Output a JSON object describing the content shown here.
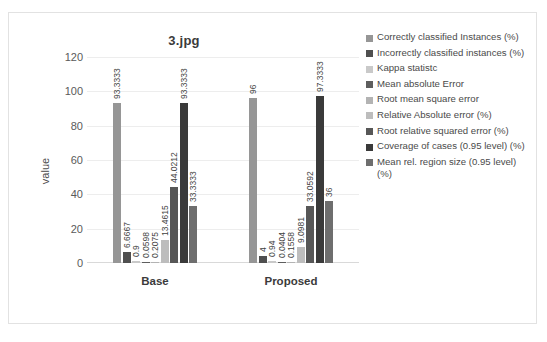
{
  "chart_data": {
    "type": "bar",
    "title": "3.jpg",
    "xlabel": "",
    "ylabel": "value",
    "ylim": [
      0,
      120
    ],
    "yticks": [
      120,
      100,
      80,
      60,
      40,
      20,
      0
    ],
    "grid": true,
    "legend_position": "right",
    "categories": [
      "Base",
      "Proposed"
    ],
    "series": [
      {
        "name": "Correctly classified Instances (%)",
        "color": "#969696",
        "values": [
          93.3333,
          96
        ]
      },
      {
        "name": "Incorrectly classified instances (%)",
        "color": "#4f4f4f",
        "values": [
          6.6667,
          4
        ]
      },
      {
        "name": "Kappa statistc",
        "color": "#c9c9c9",
        "values": [
          0.9,
          0.94
        ]
      },
      {
        "name": "Mean absolute Error",
        "color": "#5e5e5e",
        "values": [
          0.0598,
          0.0404
        ]
      },
      {
        "name": "Root mean square error",
        "color": "#b3b3b3",
        "values": [
          0.2075,
          0.1558
        ]
      },
      {
        "name": "Relative Absolute error (%)",
        "color": "#bdbdbd",
        "values": [
          13.4615,
          9.0981
        ]
      },
      {
        "name": "Root relative squared error (%)",
        "color": "#575757",
        "values": [
          44.0212,
          33.0592
        ]
      },
      {
        "name": "Coverage of cases (0.95 level) (%)",
        "color": "#3a3a3a",
        "values": [
          93.3333,
          97.3333
        ]
      },
      {
        "name": "Mean rel. region size (0.95 level) (%)",
        "color": "#6e6e6e",
        "values": [
          33.3333,
          36
        ]
      }
    ],
    "value_labels": {
      "Base": [
        "93.3333",
        "6.6667",
        "0.9",
        "0.0598",
        "0.2075",
        "13.4615",
        "44.0212",
        "93.3333",
        "33.3333"
      ],
      "Proposed": [
        "96",
        "4",
        "0.94",
        "0.0404",
        "0.1558",
        "9.0981",
        "33.0592",
        "97.3333",
        "36"
      ]
    }
  }
}
